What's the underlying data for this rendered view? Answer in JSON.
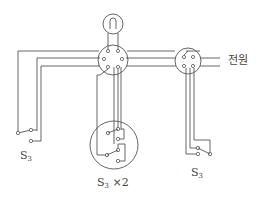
{
  "diagram": {
    "type": "electrical wiring diagram",
    "components": {
      "lamp": {
        "name": "lamp",
        "symbol": "lamp-circle"
      },
      "junction_box_main": {
        "name": "junction box",
        "terminals": 6
      },
      "junction_box_right": {
        "name": "junction box",
        "terminals": 4
      },
      "switch_left": {
        "label_main": "S",
        "label_sub": "3"
      },
      "switch_center": {
        "label_main": "S",
        "label_sub": "3",
        "label_suffix": " ×2"
      },
      "switch_right": {
        "label_main": "S",
        "label_sub": "3"
      }
    },
    "labels": {
      "power": "전원"
    },
    "colors": {
      "line": "#555555",
      "background": "#ffffff"
    }
  }
}
